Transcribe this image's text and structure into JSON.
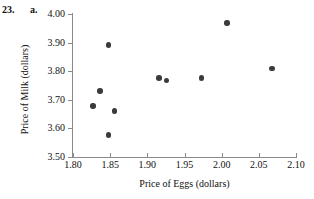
{
  "exercise": {
    "number": "23.",
    "part": "a."
  },
  "chart_data": {
    "type": "scatter",
    "title": "",
    "xlabel": "Price of Eggs (dollars)",
    "ylabel": "Price of Milk (dollars)",
    "xlim": [
      1.8,
      2.1
    ],
    "ylim": [
      3.5,
      4.0
    ],
    "xticks": [
      "1.80",
      "1.85",
      "1.90",
      "1.95",
      "2.00",
      "2.05",
      "2.10"
    ],
    "yticks": [
      "3.50",
      "3.60",
      "3.70",
      "3.80",
      "3.90",
      "4.00"
    ],
    "xtick_values": [
      1.8,
      1.85,
      1.9,
      1.95,
      2.0,
      2.05,
      2.1
    ],
    "ytick_values": [
      3.5,
      3.6,
      3.7,
      3.8,
      3.9,
      4.0
    ],
    "grid": false,
    "legend": null,
    "marker_color": "#3b3b3b",
    "axis_color": "#8a8a8a",
    "points": [
      {
        "x": 1.827,
        "y": 3.678
      },
      {
        "x": 1.836,
        "y": 3.731
      },
      {
        "x": 1.848,
        "y": 3.892
      },
      {
        "x": 1.848,
        "y": 3.577
      },
      {
        "x": 1.856,
        "y": 3.661
      },
      {
        "x": 1.916,
        "y": 3.776
      },
      {
        "x": 1.926,
        "y": 3.767
      },
      {
        "x": 1.973,
        "y": 3.776
      },
      {
        "x": 2.007,
        "y": 3.968
      },
      {
        "x": 2.068,
        "y": 3.81
      }
    ]
  }
}
